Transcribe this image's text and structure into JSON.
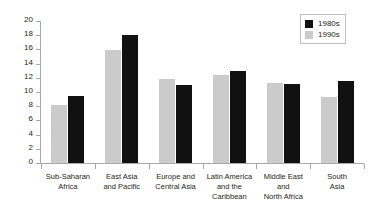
{
  "chart_data": {
    "type": "bar",
    "title": "",
    "subtitle": "",
    "xlabel": "",
    "ylabel": "",
    "ylim": [
      0,
      20
    ],
    "y_ticks": [
      0,
      2,
      4,
      6,
      8,
      10,
      12,
      14,
      16,
      18,
      20
    ],
    "grid": false,
    "legend_position": "top-right",
    "categories": [
      "Sub-Saharan\nAfrica",
      "East Asia\nand Pacific",
      "Europe and\nCentral Asia",
      "Latin America\nand the\nCaribbean",
      "Middle East\nand\nNorth Africa",
      "South\nAsia"
    ],
    "series": [
      {
        "name": "1980s",
        "color": "#111111",
        "values": [
          9.5,
          18.0,
          11.0,
          12.9,
          11.1,
          11.5
        ]
      },
      {
        "name": "1990s",
        "color": "#cbcbcb",
        "values": [
          8.2,
          15.9,
          11.8,
          12.4,
          11.3,
          9.3
        ]
      }
    ],
    "bar_draw_order": [
      "1990s",
      "1980s"
    ]
  },
  "legend": {
    "items": [
      {
        "label": "1980s",
        "color": "#111111"
      },
      {
        "label": "1990s",
        "color": "#cbcbcb"
      }
    ]
  },
  "axis": {
    "line_color": "#a7a9ac",
    "tick_color": "#a7a9ac"
  }
}
